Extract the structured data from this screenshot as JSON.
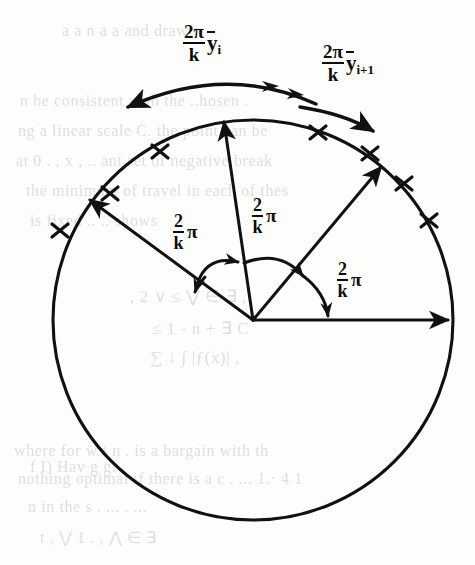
{
  "figure": {
    "kind": "geometry-diagram",
    "ink_color": "#111111",
    "background_color": "#fdfdfb",
    "bleed_text_color": "#b9b4ad"
  },
  "circle": {
    "center_x": 253,
    "center_y": 320,
    "radius": 200,
    "tick_symbol": "x"
  },
  "arc_labels": [
    {
      "id": "arc-label-left",
      "numerator": "2π",
      "denominator": "k",
      "variable": "y",
      "subscript": "i",
      "overbar": true,
      "text": "2π ȳᵢ / k"
    },
    {
      "id": "arc-label-right",
      "numerator": "2π",
      "denominator": "k",
      "variable": "y",
      "subscript": "i+1",
      "overbar": true,
      "text": "2π ȳᵢ₊₁ / k"
    }
  ],
  "angle_labels": [
    {
      "id": "angle-label-left",
      "numerator": "2",
      "denominator": "k",
      "symbol": "π",
      "text": "2/k π"
    },
    {
      "id": "angle-label-middle",
      "numerator": "2",
      "denominator": "k",
      "symbol": "π",
      "text": "2/k π"
    },
    {
      "id": "angle-label-right",
      "numerator": "2",
      "denominator": "k",
      "symbol": "π",
      "text": "2/k π"
    }
  ],
  "radii": [
    {
      "id": "radius-east",
      "angle_deg": 0,
      "arrowhead": true
    },
    {
      "id": "radius-northeast",
      "angle_deg": 50,
      "arrowhead": true
    },
    {
      "id": "radius-north",
      "angle_deg": 87,
      "arrowhead": true
    },
    {
      "id": "radius-northwest",
      "angle_deg": 143,
      "arrowhead": true
    }
  ],
  "background_text": {
    "lines": [
      "a    a     n    a  a    and  drawin",
      "n be consistent with the ..hosen  .",
      "ng  a  linear  scale  C. the point  can  be",
      "at  0 . , x   , .. ant set of negative  break",
      "the  minimum  of  travel in each of thes",
      "is  fixed  .. .. shows",
      ",  2   ∨    ≤   ⋁   ∈ ∃ ,",
      "≤ 1 - n  + ∃ C",
      "∑ ↓  ∫ |ƒ(x)| ,",
      "where for  w t  n  .  is a bargain with th",
      "nothing  optimal if  there  is a  c . ... 1.· 4 1",
      "n in the  s .    ... .  ...",
      "f I) Hav  g  gr",
      "t  ,  ⋁  1   . ,  ⋀  ∈  ∃"
    ]
  }
}
